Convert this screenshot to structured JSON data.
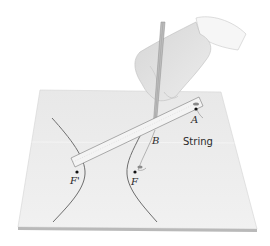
{
  "figure": {
    "labels": {
      "point_a": "A",
      "point_b": "B",
      "focus_f_prime": "F'",
      "focus_f": "F",
      "string": "String"
    },
    "colors": {
      "paper": "#ececec",
      "paper_edge": "#b9b9b9",
      "curve": "#6e6e6e",
      "ruler": "#f4f4f4",
      "ruler_edge": "#8a8a8a",
      "hand": "#e0e0e0",
      "sleeve": "#f6f6f6",
      "label": "#2a2a2a"
    }
  }
}
